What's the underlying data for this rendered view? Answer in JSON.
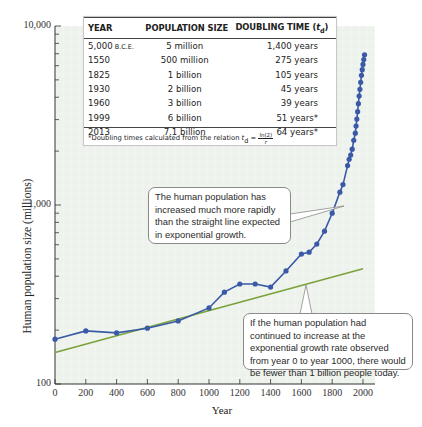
{
  "chart_data": {
    "type": "line",
    "title": "",
    "xlabel": "Year",
    "ylabel": "Human population size (millions)",
    "yscale": "log",
    "xlim": [
      0,
      2000
    ],
    "ylim": [
      100,
      10000
    ],
    "x_ticks": [
      "0",
      "200",
      "400",
      "600",
      "800",
      "1000",
      "1200",
      "1400",
      "1600",
      "1800",
      "2000"
    ],
    "y_ticks": [
      "100",
      "1,000",
      "10,000"
    ],
    "grid": true,
    "series": [
      {
        "name": "Human population (observed)",
        "color": "#3a5aa8",
        "marker": "circle",
        "x": [
          0,
          200,
          400,
          600,
          800,
          1000,
          1100,
          1200,
          1300,
          1400,
          1500,
          1600,
          1650,
          1700,
          1750,
          1800,
          1850,
          1870,
          1900,
          1910,
          1920,
          1930,
          1940,
          1950,
          1955,
          1960,
          1965,
          1970,
          1975,
          1980,
          1985,
          1990,
          1995,
          2000,
          2005,
          2010
        ],
        "values": [
          178,
          198,
          193,
          205,
          225,
          266,
          326,
          362,
          362,
          348,
          428,
          532,
          545,
          605,
          714,
          900,
          1180,
          1300,
          1660,
          1800,
          1900,
          2050,
          2300,
          2520,
          2760,
          3020,
          3320,
          3680,
          4060,
          4430,
          4850,
          5300,
          5700,
          6100,
          6500,
          6900
        ]
      },
      {
        "name": "Exponential growth projected from years 0–1000",
        "color": "#7aa23a",
        "marker": "none",
        "x": [
          0,
          2000
        ],
        "values": [
          150,
          440
        ]
      }
    ],
    "annotations": [
      "The human population has increased much more rapidly than the straight line expected in exponential growth.",
      "If the human population had continued to increase at the exponential growth rate observed from year 0 to year 1000, there would be fewer than 1 billion people today."
    ],
    "inset_table": {
      "headers": [
        "YEAR",
        "POPULATION SIZE",
        "DOUBLING TIME (t_d)"
      ],
      "rows": [
        [
          "5,000 B.C.E.",
          "5 million",
          "1,400 years"
        ],
        [
          "1550",
          "500 million",
          "275 years"
        ],
        [
          "1825",
          "1 billion",
          "105 years"
        ],
        [
          "1930",
          "2 billion",
          "45 years"
        ],
        [
          "1960",
          "3 billion",
          "39 years"
        ],
        [
          "1999",
          "6 billion",
          "51 years*"
        ],
        [
          "2013",
          "7.1 billion",
          "64 years*"
        ]
      ],
      "footnote": "*Doubling times calculated from the relation t_d = ln(2)/r"
    }
  },
  "table": {
    "h_year": "YEAR",
    "h_pop": "POPULATION SIZE",
    "h_dbl": "DOUBLING TIME (",
    "h_dbl_t": "t",
    "h_dbl_sub": "d",
    "h_dbl_end": ")",
    "rows": [
      {
        "year": "5,000",
        "year_suffix": " B.C.E.",
        "pop": "5 million",
        "dbl": "1,400 years"
      },
      {
        "year": "1550",
        "year_suffix": "",
        "pop": "500 million",
        "dbl": "275 years"
      },
      {
        "year": "1825",
        "year_suffix": "",
        "pop": "1 billion",
        "dbl": "105 years"
      },
      {
        "year": "1930",
        "year_suffix": "",
        "pop": "2 billion",
        "dbl": "45 years"
      },
      {
        "year": "1960",
        "year_suffix": "",
        "pop": "3 billion",
        "dbl": "39 years"
      },
      {
        "year": "1999",
        "year_suffix": "",
        "pop": "6 billion",
        "dbl": "51 years*"
      },
      {
        "year": "2013",
        "year_suffix": "",
        "pop": "7.1 billion",
        "dbl": "64 years*"
      }
    ],
    "note_prefix": "*Doubling times calculated from the relation ",
    "note_t": "t",
    "note_sub": "d",
    "note_eq": " = ",
    "note_num": "ln(2)",
    "note_den": "r"
  },
  "callouts": {
    "a": "The human population has increased much more rapidly than the straight line expected in exponential growth.",
    "b": "If the human population had continued to increase at the exponential growth rate observed from year 0 to year 1000, there would be fewer than 1 billion people today."
  },
  "axes": {
    "y_title": "Human population size (millions)",
    "x_title": "Year",
    "y_ticks": [
      {
        "label": "10,000",
        "value": 10000
      },
      {
        "label": "1,000",
        "value": 1000
      },
      {
        "label": "100",
        "value": 100
      }
    ],
    "x_ticks": [
      "0",
      "200",
      "400",
      "600",
      "800",
      "1000",
      "1200",
      "1400",
      "1600",
      "1800",
      "2000"
    ]
  },
  "colors": {
    "plot_bg": "#eef2ec",
    "grid": "#ffffff",
    "observed": "#3a5aa8",
    "exponential": "#7aa23a",
    "axis": "#333333"
  }
}
